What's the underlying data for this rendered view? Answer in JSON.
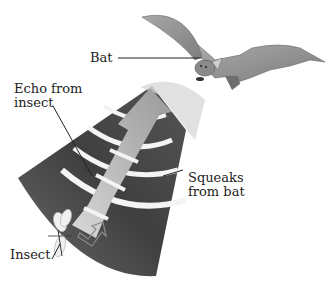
{
  "diagram": {
    "labels": {
      "bat": "Bat",
      "echo": "Echo from\ninsect",
      "squeaks": "Squeaks\nfrom bat",
      "insect": "Insect"
    },
    "colors": {
      "cone_dark": "#4a4a4a",
      "cone_mid": "#6e6e6e",
      "wave_band": "#f2f2f2",
      "echo_arrow": "#bdbdbd",
      "squeak_arrow": "#7a7a7a",
      "bat": "#8c8c8c",
      "text": "#222222"
    }
  }
}
